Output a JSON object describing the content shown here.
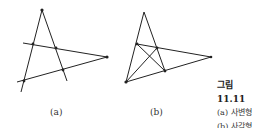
{
  "figure": {
    "panels": [
      {
        "id": "a",
        "label": "(a)"
      },
      {
        "id": "b",
        "label": "(b)"
      }
    ],
    "caption": {
      "title": "그림 11.11",
      "lines": [
        "(a) 사변형",
        "(b) 사각형"
      ]
    }
  }
}
